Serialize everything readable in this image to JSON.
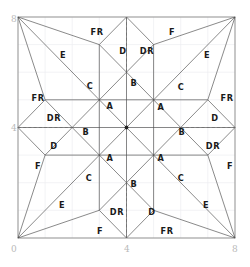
{
  "figure": {
    "title": "",
    "type": "mesh-region-diagram",
    "domain": {
      "x_min": 0,
      "x_max": 8,
      "y_min": 0,
      "y_max": 8
    }
  },
  "axes": {
    "x_ticks": [
      {
        "value": 0,
        "label": "0",
        "px": 18
      },
      {
        "value": 4,
        "label": "4",
        "px": 126.5
      },
      {
        "value": 8,
        "label": "8",
        "px": 235
      }
    ],
    "y_ticks": [
      {
        "value": 0,
        "label": "0",
        "px": 238
      },
      {
        "value": 4,
        "label": "4",
        "px": 127.5
      },
      {
        "value": 8,
        "label": "8",
        "px": 17
      }
    ],
    "corner_labels": {
      "bottom_left": "0",
      "bottom_center": "4",
      "bottom_right": "8",
      "top_left": "8",
      "middle_left": "4"
    },
    "grid": true,
    "grid_step": 1
  },
  "chart_data": {
    "type": "diagram",
    "title": "",
    "xlabel": "",
    "ylabel": "",
    "xlim": [
      0,
      8
    ],
    "ylim": [
      0,
      8
    ],
    "grid": true,
    "legend": "none",
    "region_codes": [
      "A",
      "B",
      "C",
      "D",
      "DR",
      "E",
      "F",
      "FR"
    ],
    "regions": [
      {
        "label": "FR",
        "x": 97,
        "y": 32
      },
      {
        "label": "F",
        "x": 172,
        "y": 32
      },
      {
        "label": "E",
        "x": 63,
        "y": 55
      },
      {
        "label": "E",
        "x": 207,
        "y": 55
      },
      {
        "label": "D",
        "x": 123,
        "y": 51
      },
      {
        "label": "DR",
        "x": 147,
        "y": 51
      },
      {
        "label": "C",
        "x": 90,
        "y": 86
      },
      {
        "label": "C",
        "x": 181,
        "y": 87
      },
      {
        "label": "B",
        "x": 134,
        "y": 83
      },
      {
        "label": "FR",
        "x": 38,
        "y": 98
      },
      {
        "label": "FR",
        "x": 227,
        "y": 98
      },
      {
        "label": "A",
        "x": 110,
        "y": 106
      },
      {
        "label": "A",
        "x": 161,
        "y": 107
      },
      {
        "label": "DR",
        "x": 54,
        "y": 118
      },
      {
        "label": "D",
        "x": 215,
        "y": 118
      },
      {
        "label": "B",
        "x": 86,
        "y": 132
      },
      {
        "label": "B",
        "x": 182,
        "y": 132
      },
      {
        "label": "D",
        "x": 54,
        "y": 146
      },
      {
        "label": "DR",
        "x": 213,
        "y": 146
      },
      {
        "label": "A",
        "x": 110,
        "y": 158
      },
      {
        "label": "A",
        "x": 161,
        "y": 158
      },
      {
        "label": "F",
        "x": 38,
        "y": 166
      },
      {
        "label": "F",
        "x": 230,
        "y": 166
      },
      {
        "label": "C",
        "x": 89,
        "y": 178
      },
      {
        "label": "C",
        "x": 181,
        "y": 178
      },
      {
        "label": "B",
        "x": 134,
        "y": 184
      },
      {
        "label": "E",
        "x": 62,
        "y": 205
      },
      {
        "label": "E",
        "x": 206,
        "y": 205
      },
      {
        "label": "DR",
        "x": 117,
        "y": 212
      },
      {
        "label": "D",
        "x": 152,
        "y": 212
      },
      {
        "label": "F",
        "x": 100,
        "y": 231
      },
      {
        "label": "FR",
        "x": 167,
        "y": 231
      }
    ]
  },
  "colors": {
    "background": "#ffffff",
    "frame": "#9a9a9a",
    "mesh": "#4a4a4a",
    "grid": "#eceef0",
    "dash": "#6f6f6f",
    "label_text": "#1a1a1a",
    "axis_text": "#b9b9b9"
  }
}
